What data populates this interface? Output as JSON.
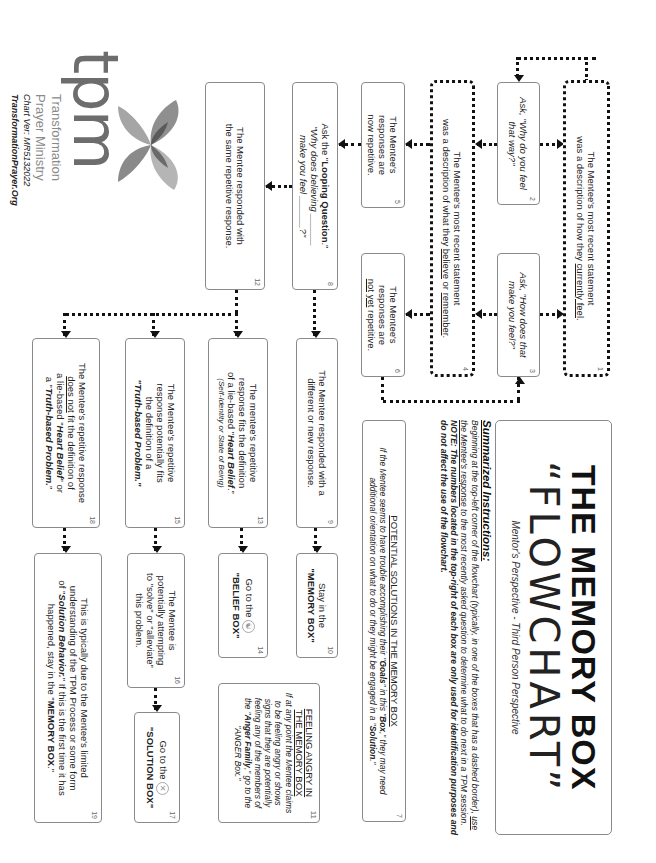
{
  "title": {
    "line1": "THE MEMORY BOX",
    "line2": "“FLOWCHART”",
    "subtitle": "Mentor's Perspective - Third Person Perspective"
  },
  "instructions": {
    "heading": "Summarized Instructions:",
    "p1": "Beginning at the top-left corner of the flowchart (typically, in one of the boxes that has a dashed border), ",
    "p1_underlined": "use the Mentee's response",
    "p2": " to the most recently asked question to determine what to do next in a TPM session. ",
    "note": "NOTE: The numbers located in the top-right of each box are only used for identification purposes and do not affect the use of the flowchart."
  },
  "boxes": {
    "b1": {
      "num": "1",
      "line1": "The Mentee's most recent statement",
      "line2_pre": "was a description of how they ",
      "line2_u": "currently feel",
      "line2_post": "."
    },
    "b2": {
      "num": "2",
      "line1": "Ask, \"Why do you feel",
      "line2": "that way?\""
    },
    "b3": {
      "num": "3",
      "line1": "Ask, \"How does that",
      "line2": "make you feel?\""
    },
    "b4": {
      "num": "4",
      "line1": "The Mentee's most recent statement",
      "line2_pre": "was a description of what they ",
      "line2_u1": "believe",
      "line2_mid": " or ",
      "line2_u2": "remember",
      "line2_post": "."
    },
    "b5": {
      "num": "5",
      "line1": "The Mentee's",
      "line2": "responses are",
      "line3": "now repetitive."
    },
    "b6": {
      "num": "6",
      "line1": "The Mentee's",
      "line2": "responses are",
      "line3_u1": "not",
      "line3_sp": " ",
      "line3_u2": "yet",
      "line3_post": " repetitive."
    },
    "b7": {
      "num": "7",
      "heading": "POTENTIAL SOLUTIONS IN THE MEMORY BOX",
      "text1": "If the Mentee seems to have trouble accomplishing their \"",
      "goals": "Goals",
      "text2": "\" in this \"",
      "box": "Box",
      "text3": ",\" they may need additional orientation on what to do or they might be engaged in a \"",
      "solution": "Solution",
      "text4": ".\""
    },
    "b8": {
      "num": "8",
      "line1_pre": "Ask the \"",
      "line1_b": "Looping Question",
      "line1_post": ".\"",
      "line2": "\"Why does believing ______",
      "line3": "make you feel ______?\""
    },
    "b9": {
      "num": "9",
      "line1": "The Mentee responded with a",
      "line2": "different or new response."
    },
    "b10": {
      "num": "10",
      "line1": "Stay in the",
      "line2": "\"MEMORY BOX\""
    },
    "b11": {
      "num": "11",
      "heading1": "FEELING ANGRY IN",
      "heading2": "THE MEMORY BOX",
      "text1": "If at any point the Mentee claims to be feeling angry or shows signs that they are potentially feeling any of the members of the \"",
      "family": "Anger Family",
      "text2": ",\" go to the \"ANGER Box.\""
    },
    "b12": {
      "num": "12",
      "line1": "The Mentee responded with",
      "line2": "the same repetitive response."
    },
    "b13": {
      "num": "13",
      "line1": "The mentee's repetitive",
      "line2": "response fits the definition",
      "line3_pre": "of a lie-based \"",
      "line3_b": "Heart Belief",
      "line3_post": ".\"",
      "line4": "(Self-Identity or State of Being)"
    },
    "b14": {
      "num": "14",
      "line1": "Go to the",
      "line2": "\"BELIEF BOX\"",
      "icon": "belief-box-icon"
    },
    "b15": {
      "num": "15",
      "line1": "The Mentee's repetitive",
      "line2": "response potentially fits",
      "line3": "the definition of a",
      "line4_b": "\"Truth-based Problem.\""
    },
    "b16": {
      "num": "16",
      "line1": "The Mentee is",
      "line2": "potentially attempting",
      "line3": "to \"solve\" or \"alleviate\"",
      "line4": "this problem."
    },
    "b17": {
      "num": "17",
      "line1": "Go to the",
      "line2": "\"SOLUTION BOX\"",
      "icon": "solution-box-icon"
    },
    "b18": {
      "num": "18",
      "line1": "The Mentee's repetitive response",
      "line2_u": "does not",
      "line2_post": " fit the definition of",
      "line3_pre": "a lie-based \"",
      "line3_b": "Heart Belief",
      "line3_post": "\" or",
      "line4_pre": "a \"",
      "line4_b": "Truth-based Problem.",
      "line4_post": "\""
    },
    "b19": {
      "num": "19",
      "line1": "This is typically due to the Mentee's limited",
      "line2": "understanding of the TPM Process or some form",
      "line3_pre": "of \"",
      "line3_b": "Solution Behavior.",
      "line3_post": "\" If this is the first time it has",
      "line4_pre": "happened, stay in the \"",
      "line4_b": "MEMORY BOX",
      "line4_post": ".\""
    }
  },
  "logo": {
    "mark": "tpm",
    "line1": "Transformation",
    "line2": "Prayer Ministry",
    "version": "Chart Ver: MR5132022",
    "website": "TransformationPrayer.Org"
  },
  "colors": {
    "ink": "#111111",
    "border": "#8a8a8a",
    "logo_gray": "#6d6d6d",
    "leaf_light": "#b5b5b5",
    "leaf_mid": "#8f8f8f",
    "leaf_dark": "#5a5a5a"
  }
}
